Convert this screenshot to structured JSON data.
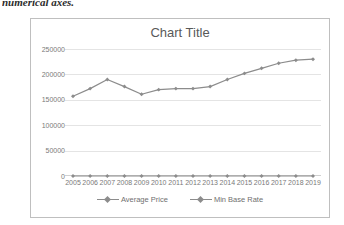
{
  "caption": {
    "text": "numerical axes."
  },
  "chart_card": {
    "title": "Chart Title"
  },
  "legend": {
    "position": "bottom",
    "entries": [
      {
        "label": "Average Price",
        "color": "#8c8c8c"
      },
      {
        "label": "Min Base Rate",
        "color": "#8c8c8c"
      }
    ]
  },
  "chart_data": {
    "type": "line",
    "title": "Chart Title",
    "xlabel": "",
    "ylabel": "",
    "grid": true,
    "legend_position": "bottom",
    "categories": [
      "2005",
      "2006",
      "2007",
      "2008",
      "2009",
      "2010",
      "2011",
      "2012",
      "2013",
      "2014",
      "2015",
      "2016",
      "2017",
      "2018",
      "2019"
    ],
    "ylim": [
      0,
      250000
    ],
    "yticks": [
      0,
      50000,
      100000,
      150000,
      200000,
      250000
    ],
    "ytick_labels": [
      "0",
      "50000",
      "100000",
      "150000",
      "200000",
      "250000"
    ],
    "series": [
      {
        "name": "Average Price",
        "color": "#8c8c8c",
        "marker": "diamond",
        "values": [
          157000,
          172000,
          190000,
          176000,
          161000,
          170000,
          172000,
          172000,
          176000,
          190000,
          202000,
          212000,
          222000,
          228000,
          230000
        ]
      },
      {
        "name": "Min Base Rate",
        "color": "#8c8c8c",
        "marker": "diamond",
        "values": [
          0,
          0,
          0,
          0,
          0,
          0,
          0,
          0,
          0,
          0,
          0,
          0,
          0,
          0,
          0
        ]
      }
    ]
  }
}
